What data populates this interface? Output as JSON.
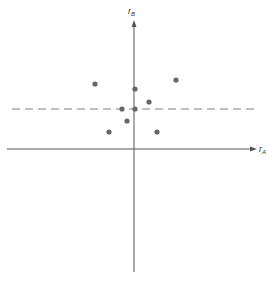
{
  "chart_data": {
    "type": "scatter",
    "title": "",
    "xlabel": "r_A",
    "ylabel": "r_B",
    "x_axis_label_main": "r",
    "x_axis_label_sub": "A",
    "y_axis_label_main": "r",
    "y_axis_label_sub": "B",
    "grid": false,
    "ticks": false,
    "reference_line": {
      "type": "horizontal",
      "style": "dashed",
      "y_pixel": 109,
      "color": "#aaaaaa"
    },
    "points_pixel": [
      {
        "x": 95,
        "y": 84
      },
      {
        "x": 176,
        "y": 80
      },
      {
        "x": 135,
        "y": 89
      },
      {
        "x": 149,
        "y": 102
      },
      {
        "x": 122,
        "y": 109
      },
      {
        "x": 135,
        "y": 109
      },
      {
        "x": 127,
        "y": 121
      },
      {
        "x": 109,
        "y": 132
      },
      {
        "x": 157,
        "y": 132
      }
    ],
    "axes_pixel": {
      "origin": {
        "x": 134,
        "y": 149
      },
      "x_axis": {
        "x_start": 7,
        "x_end": 257
      },
      "y_axis": {
        "y_top": 20,
        "y_bottom": 272
      }
    }
  },
  "colors": {
    "axis": "#555555",
    "point": "#666666",
    "dashed_line": "#aaaaaa"
  }
}
